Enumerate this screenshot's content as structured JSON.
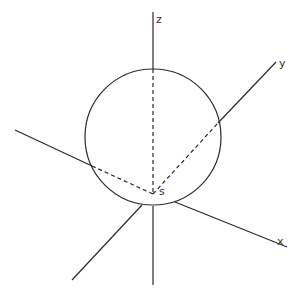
{
  "diagram": {
    "stroke_color": "#2a2a2a",
    "background": "#ffffff",
    "sphere": {
      "center": [
        153,
        137
      ],
      "radius": 68
    },
    "origin": {
      "label": "s",
      "point": [
        153,
        194
      ]
    },
    "axes": [
      {
        "name": "z",
        "label": "z",
        "solid_segments": [
          [
            [
              153,
              12
            ],
            [
              153,
              69
            ]
          ],
          [
            [
              153,
              206
            ],
            [
              153,
              285
            ]
          ]
        ],
        "dashed_segment": [
          [
            153,
            69
          ],
          [
            153,
            194
          ]
        ]
      },
      {
        "name": "y",
        "label": "y",
        "solid_segments": [
          [
            [
              218,
              123
            ],
            [
              276,
              62
            ]
          ],
          [
            [
              142,
              205
            ],
            [
              72,
              280
            ]
          ]
        ],
        "dashed_segment": [
          [
            153,
            194
          ],
          [
            218,
            123
          ]
        ]
      },
      {
        "name": "x",
        "label": "x",
        "solid_segments": [
          [
            [
              175,
              202
            ],
            [
              287,
              247
            ]
          ],
          [
            [
              15,
              130
            ],
            [
              92,
              166
            ]
          ]
        ],
        "dashed_segment": [
          [
            92,
            166
          ],
          [
            153,
            194
          ]
        ]
      }
    ],
    "labels": {
      "z": "z",
      "y": "y",
      "x": "x",
      "origin": "s"
    },
    "caption": ""
  }
}
